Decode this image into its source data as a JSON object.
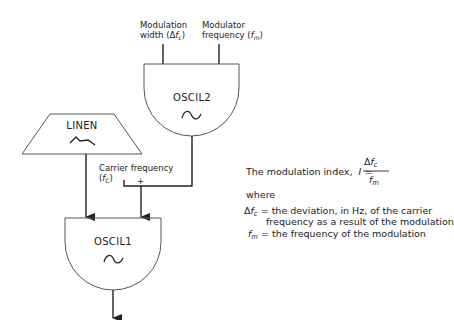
{
  "inputs": {
    "modulation_width": {
      "line1": "Modulation",
      "line2_prefix": "width (Δ",
      "line2_var": "f",
      "line2_sub": "c",
      "line2_suffix": ")"
    },
    "modulator_frequency": {
      "line1": "Modulator",
      "line2_prefix": "frequency (",
      "line2_var": "f",
      "line2_sub": "m",
      "line2_suffix": ")"
    }
  },
  "blocks": {
    "oscil2": {
      "title": "OSCIL2",
      "icon": "sine-wave-icon"
    },
    "linen": {
      "title": "LINEN",
      "icon": "envelope-icon"
    },
    "oscil1": {
      "title": "OSCIL1",
      "icon": "sine-wave-icon"
    }
  },
  "carrier": {
    "line1": "Carrier frequency",
    "line2_prefix": "(",
    "line2_var": "f",
    "line2_sub": "C",
    "line2_suffix": ")",
    "plus": "+"
  },
  "explanation": {
    "index_text": "The modulation index,",
    "index_var": "I",
    "equals": "=",
    "numerator_delta": "Δ",
    "numerator_var": "f",
    "numerator_sub": "c",
    "denominator_var": "f",
    "denominator_sub": "m",
    "where": "where",
    "def1_delta": "Δ",
    "def1_var": "f",
    "def1_sub": "c",
    "def1_text": "= the deviation, in Hz, of the carrier",
    "def1_text2": "frequency as a result of the modulation",
    "def2_var": "f",
    "def2_sub": "m",
    "def2_text": "= the frequency of the modulation"
  },
  "colors": {
    "stroke": "#222222",
    "background": "#ffffff"
  }
}
